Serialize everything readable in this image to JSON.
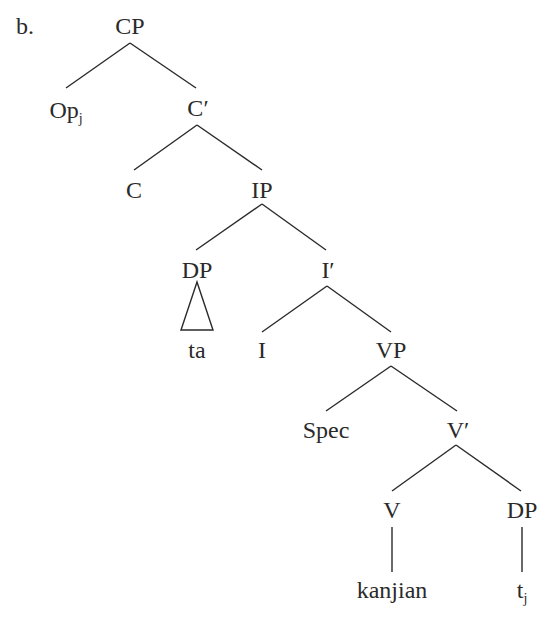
{
  "example_label": "b.",
  "nodes": {
    "cp": {
      "label": "CP"
    },
    "op": {
      "label": "Op",
      "sub": "j"
    },
    "c_bar": {
      "label": "C′"
    },
    "c": {
      "label": "C"
    },
    "ip": {
      "label": "IP"
    },
    "dp_subj": {
      "label": "DP"
    },
    "ta": {
      "label": "ta"
    },
    "i_bar": {
      "label": "I′"
    },
    "i": {
      "label": "I"
    },
    "vp": {
      "label": "VP"
    },
    "spec": {
      "label": "Spec"
    },
    "v_bar": {
      "label": "V′"
    },
    "v": {
      "label": "V"
    },
    "dp_obj": {
      "label": "DP"
    },
    "kanjian": {
      "label": "kanjian"
    },
    "trace": {
      "label": "t",
      "sub": "j"
    }
  },
  "colors": {
    "ink": "#2a2a2a",
    "background": "#ffffff"
  }
}
